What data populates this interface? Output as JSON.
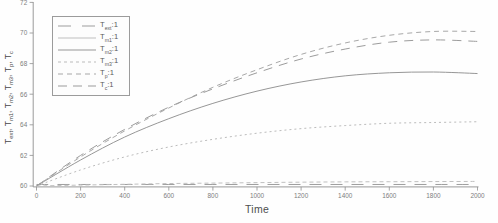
{
  "figure": {
    "background": "#fefefe",
    "axis_color": "#8f8f8f",
    "tick_label_color": "#7d7d7d",
    "axis_label_color": "#4e4e4e",
    "legend_border_color": "#9b9b9b"
  },
  "chart_data": {
    "type": "line",
    "title": "",
    "xlabel": "Time",
    "ylabel": "T_ext, T_m1, T_m2, T_m3, T_p, T_c",
    "ylabel_parts": [
      {
        "base": "T",
        "sub": "ext"
      },
      {
        "base": "T",
        "sub": "m1"
      },
      {
        "base": "T",
        "sub": "m2"
      },
      {
        "base": "T",
        "sub": "m3"
      },
      {
        "base": "T",
        "sub": "p"
      },
      {
        "base": "T",
        "sub": "c"
      }
    ],
    "xlim": [
      0,
      2000
    ],
    "ylim": [
      60,
      72
    ],
    "x_ticks": [
      0,
      200,
      400,
      600,
      800,
      1000,
      1200,
      1400,
      1600,
      1800,
      2000
    ],
    "y_ticks": [
      60,
      62,
      64,
      66,
      68,
      70,
      72
    ],
    "grid": false,
    "legend_position": "upper-left",
    "x": [
      0,
      200,
      400,
      600,
      800,
      1000,
      1200,
      1400,
      1600,
      1800,
      2000
    ],
    "series": [
      {
        "name": "T_ext:1",
        "label": {
          "base": "T",
          "sub": "ext",
          "suffix": ":1"
        },
        "color": "#9e9e9e",
        "legend_dash": "13 11",
        "plot_dash": "12 9",
        "values": [
          60.1,
          60.1,
          60.1,
          60.1,
          60.1,
          60.1,
          60.1,
          60.1,
          60.1,
          60.1,
          60.1
        ]
      },
      {
        "name": "T_m1:1",
        "label": {
          "base": "T",
          "sub": "m1",
          "suffix": ":1"
        },
        "color": "#c0c0c0",
        "legend_dash": "",
        "plot_dash": "4 3",
        "values": [
          60,
          60.06,
          60.11,
          60.16,
          60.19,
          60.22,
          60.25,
          60.27,
          60.28,
          60.29,
          60.3
        ]
      },
      {
        "name": "T_m2:1",
        "label": {
          "base": "T",
          "sub": "m2",
          "suffix": ":1"
        },
        "color": "#979797",
        "legend_dash": "",
        "plot_dash": "",
        "values": [
          60,
          61.7,
          63.2,
          64.4,
          65.4,
          66.2,
          66.8,
          67.2,
          67.4,
          67.45,
          67.35
        ]
      },
      {
        "name": "T_m3:1",
        "label": {
          "base": "T",
          "sub": "m3",
          "suffix": ":1"
        },
        "color": "#bcbcbc",
        "legend_dash": "3 3",
        "plot_dash": "2 3",
        "values": [
          60,
          61.05,
          61.9,
          62.55,
          63.05,
          63.45,
          63.75,
          63.95,
          64.1,
          64.15,
          64.2
        ]
      },
      {
        "name": "T_p:1",
        "label": {
          "base": "T",
          "sub": "p",
          "suffix": ":1"
        },
        "color": "#a8a8a8",
        "legend_dash": "5 4",
        "plot_dash": "5 4",
        "values": [
          60,
          61.9,
          63.6,
          65.1,
          66.45,
          67.6,
          68.6,
          69.35,
          69.85,
          70.1,
          70.1
        ]
      },
      {
        "name": "T_c:1",
        "label": {
          "base": "T",
          "sub": "c",
          "suffix": ":1"
        },
        "color": "#9c9c9c",
        "legend_dash": "9 6",
        "plot_dash": "9 7",
        "values": [
          60,
          62.0,
          63.7,
          65.15,
          66.35,
          67.4,
          68.3,
          68.95,
          69.4,
          69.55,
          69.45
        ]
      }
    ]
  }
}
